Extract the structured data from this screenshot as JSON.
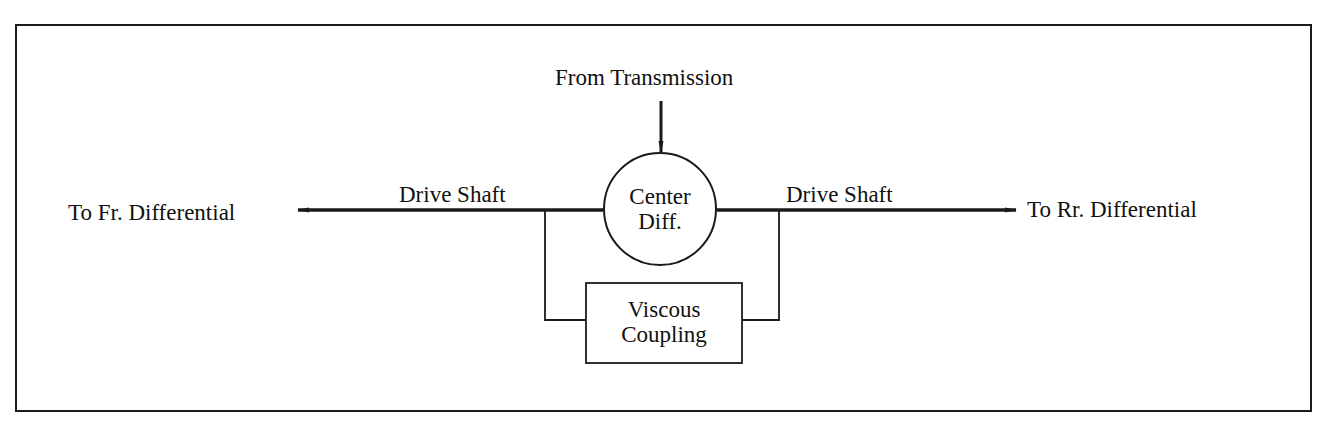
{
  "diagram": {
    "input": {
      "label": "From Transmission"
    },
    "center_diff": {
      "line1": "Center",
      "line2": "Diff."
    },
    "left_shaft": {
      "label": "Drive Shaft"
    },
    "right_shaft": {
      "label": "Drive Shaft"
    },
    "left_output": {
      "label": "To Fr. Differential"
    },
    "right_output": {
      "label": "To Rr. Differential"
    },
    "viscous_coupling": {
      "line1": "Viscous",
      "line2": "Coupling"
    },
    "colors": {
      "line": "#1a1a1a",
      "background": "#ffffff"
    }
  }
}
